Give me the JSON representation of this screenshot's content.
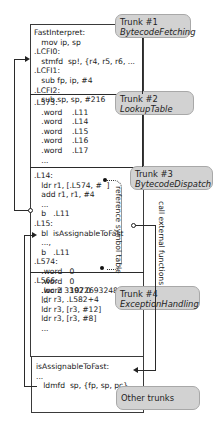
{
  "trunks": [
    {
      "title": "Trunk #1",
      "name": "BytecodeFetching"
    },
    {
      "title": "Trunk #2",
      "name": "LookupTable"
    },
    {
      "title": "Trunk #3",
      "name": "BytecodeDispatch"
    },
    {
      "title": "Trunk #4",
      "name": "ExceptionHandling"
    },
    {
      "title": "Other trunks",
      "name": ""
    }
  ],
  "blocks": {
    "fetching": "FastInterpret:\n   mov ip, sp\n.LCFI0:\n   stmfd  sp!, {r4, r5, r6, ...\n.LCFI1:\n   sub fp, ip, #4\n.LCFI2:\n   sub sp, sp, #216",
    "lookup": ".L573:\n   .word    .L11\n   .word    .L14\n   .word    .L15\n   .word    .L16\n   .word    .L17\n   ...",
    "dispatch": ".L14:\n   ldr r1, [.L574, #  ]\n   add r1, r1, #4\n   ...\n   b   .L11\n.L15:\n   bl  isAssignableToFast\n   ...,\n   b   .L11\n.L574:\n   .word   0\n   .word   0\n   .word   1072693248\n   ...",
    "exception": ".L566:\n   .loc 2 3392 0\n   ldr r3, .L582+4\n   ldr r3, [r3, #12]\n   ldr r3, [r3, #8]\n   ...",
    "other": "isAssignableToFast:\n...\n   ldmfd  sp, {fp, sp, pc}"
  },
  "annotations": {
    "reference_symbol_table": "reference symbol table",
    "call_external_functions": "call external functions"
  },
  "colors": {
    "trunk_fill": "#d2d2d2",
    "trunk_border": "#a8a8a8",
    "frame_border": "#3a3a3a",
    "line": "#2a2a2a"
  }
}
